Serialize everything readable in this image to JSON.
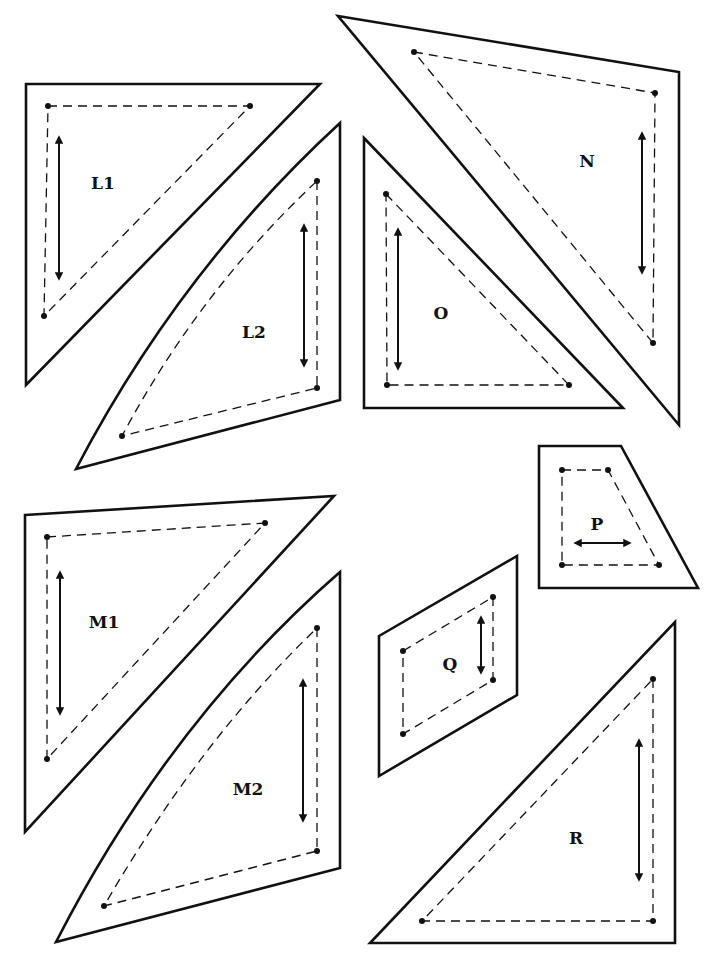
{
  "diagram": {
    "colors": {
      "ink": "#111111",
      "paper": "#ffffff"
    },
    "legend": {
      "solid_line": "cutting line",
      "dashed_line": "seam line",
      "dot": "seam corner point",
      "double_arrow": "grainline"
    },
    "pieces": [
      {
        "id": "L1",
        "label": "L1",
        "outline": "26,84 320,84 26,385",
        "seam": "48,106 250,106 44,316",
        "dots": [
          [
            48,
            106
          ],
          [
            250,
            106
          ],
          [
            44,
            316
          ]
        ],
        "grain": {
          "x1": 59,
          "y1": 137,
          "x2": 59,
          "y2": 279
        },
        "label_pos": [
          103,
          189
        ]
      },
      {
        "id": "L2",
        "label": "L2",
        "outline_path": "M340,123 L340,400 L76,469 Q180,270 340,123 Z",
        "seam_path": "M317,181 L317,388 L122,436 Q200,290 317,181",
        "dots": [
          [
            317,
            181
          ],
          [
            317,
            388
          ],
          [
            122,
            436
          ]
        ],
        "grain": {
          "x1": 304,
          "y1": 225,
          "x2": 304,
          "y2": 366
        },
        "label_pos": [
          254,
          338
        ]
      },
      {
        "id": "N",
        "label": "N",
        "outline": "338,16 679,72 679,425",
        "seam": "414,52 655,93 653,343",
        "dots": [
          [
            414,
            52
          ],
          [
            655,
            93
          ],
          [
            653,
            343
          ]
        ],
        "grain": {
          "x1": 642,
          "y1": 133,
          "x2": 642,
          "y2": 273
        },
        "label_pos": [
          587,
          167
        ]
      },
      {
        "id": "O",
        "label": "O",
        "outline": "364,138 623,408 364,408",
        "seam": "386,194 569,385 387,385",
        "dots": [
          [
            386,
            194
          ],
          [
            569,
            385
          ],
          [
            387,
            385
          ]
        ],
        "grain": {
          "x1": 398,
          "y1": 229,
          "x2": 398,
          "y2": 369
        },
        "label_pos": [
          441,
          319
        ]
      },
      {
        "id": "P",
        "label": "P",
        "outline": "539,446 621,446 698,588 539,588",
        "seam": "562,470 608,470 659,565 562,565",
        "dots": [
          [
            562,
            470
          ],
          [
            608,
            470
          ],
          [
            659,
            565
          ],
          [
            562,
            565
          ]
        ],
        "grain": {
          "x1": 575,
          "y1": 543,
          "x2": 630,
          "y2": 543,
          "horizontal": true
        },
        "label_pos": [
          597,
          530
        ]
      },
      {
        "id": "Q",
        "label": "Q",
        "outline": "379,636 517,556 517,695 379,776",
        "seam": "403,651 493,597 493,680 403,734",
        "dots": [
          [
            403,
            651
          ],
          [
            493,
            597
          ],
          [
            493,
            680
          ],
          [
            403,
            734
          ]
        ],
        "grain": {
          "x1": 481,
          "y1": 617,
          "x2": 481,
          "y2": 673
        },
        "label_pos": [
          450,
          670
        ]
      },
      {
        "id": "M1",
        "label": "M1",
        "outline": "25,515 334,496 25,832",
        "seam": "47,537 265,523 47,759",
        "dots": [
          [
            47,
            537
          ],
          [
            265,
            523
          ],
          [
            47,
            759
          ]
        ],
        "grain": {
          "x1": 60,
          "y1": 572,
          "x2": 60,
          "y2": 714
        },
        "label_pos": [
          104,
          628
        ]
      },
      {
        "id": "M2",
        "label": "M2",
        "outline_path": "M340,572 L340,868 L56,942 Q170,720 340,572 Z",
        "seam_path": "M317,628 L317,851 L104,906 Q200,740 317,628",
        "dots": [
          [
            317,
            628
          ],
          [
            317,
            851
          ],
          [
            104,
            906
          ]
        ],
        "grain": {
          "x1": 303,
          "y1": 680,
          "x2": 303,
          "y2": 821
        },
        "label_pos": [
          248,
          795
        ]
      },
      {
        "id": "R",
        "label": "R",
        "outline": "675,622 675,943 370,943",
        "seam": "653,679 653,921 422,921",
        "dots": [
          [
            653,
            679
          ],
          [
            653,
            921
          ],
          [
            422,
            921
          ]
        ],
        "grain": {
          "x1": 639,
          "y1": 740,
          "x2": 639,
          "y2": 880
        },
        "label_pos": [
          576,
          844
        ]
      }
    ]
  }
}
